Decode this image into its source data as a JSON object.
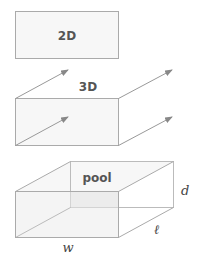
{
  "panels": {
    "two_d": {
      "label": "2D"
    },
    "three_d": {
      "label": "3D"
    },
    "pool": {
      "label": "pool",
      "dim_width": "w",
      "dim_length": "ℓ",
      "dim_depth": "d"
    }
  },
  "colors": {
    "stroke": "#aaaaaa",
    "fill": "#f4f4f4",
    "arrow": "#888888",
    "text": "#555555"
  }
}
